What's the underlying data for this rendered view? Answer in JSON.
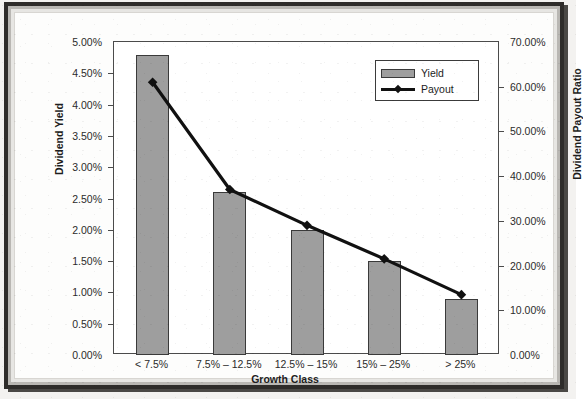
{
  "chart_data": {
    "type": "bar",
    "title": "",
    "xlabel": "Growth Class",
    "ylabel": "Dividend Yield",
    "y2label": "Dividend Payout Ratio",
    "categories": [
      "< 7.5%",
      "7.5% – 12.5%",
      "12.5% – 15%",
      "15% – 25%",
      "> 25%"
    ],
    "ylim": [
      0,
      5
    ],
    "y2lim": [
      0,
      70
    ],
    "grid": false,
    "legend_position": "top-right",
    "series": [
      {
        "name": "Yield",
        "type": "bar",
        "axis": "left",
        "color": "#9e9e9e",
        "values": [
          4.8,
          2.6,
          2.0,
          1.5,
          0.9
        ]
      },
      {
        "name": "Payout",
        "type": "line",
        "axis": "right",
        "color": "#111111",
        "values": [
          61.0,
          37.0,
          29.0,
          21.5,
          13.5
        ]
      }
    ],
    "left_axis_ticks": [
      "0.00%",
      "0.50%",
      "1.00%",
      "1.50%",
      "2.00%",
      "2.50%",
      "3.00%",
      "3.50%",
      "4.00%",
      "4.50%",
      "5.00%"
    ],
    "right_axis_ticks": [
      "0.00%",
      "10.00%",
      "20.00%",
      "30.00%",
      "40.00%",
      "50.00%",
      "60.00%",
      "70.00%"
    ]
  },
  "legend": {
    "items": [
      {
        "label": "Yield",
        "marker": "bar-swatch"
      },
      {
        "label": "Payout",
        "marker": "line-diamond"
      }
    ]
  }
}
